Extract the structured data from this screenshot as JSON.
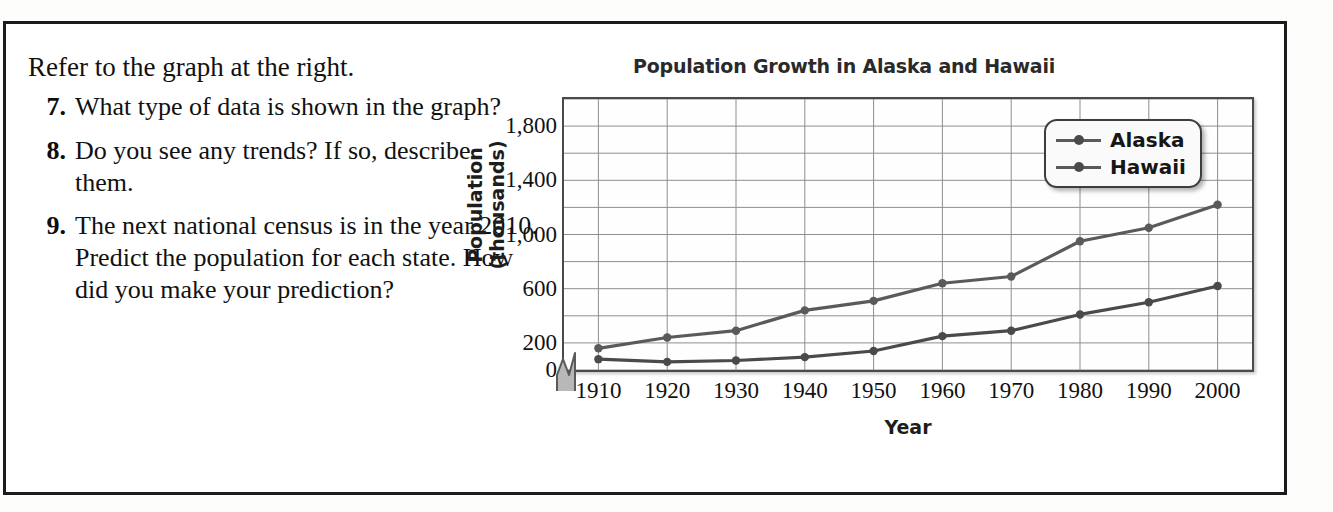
{
  "panel": {
    "intro": "Refer to the graph at the right.",
    "questions": [
      {
        "num": "7.",
        "text": "What type of data is shown in the graph?"
      },
      {
        "num": "8.",
        "text": "Do you see any trends? If so, describe them."
      },
      {
        "num": "9.",
        "text": "The next national census is in the year 2010. Predict the population for each state. How did you make your prediction?"
      }
    ]
  },
  "chart_data": {
    "type": "line",
    "title": "Population Growth in Alaska and Hawaii",
    "xlabel": "Year",
    "ylabel": "Population (thousands)",
    "categories": [
      "1910",
      "1920",
      "1930",
      "1940",
      "1950",
      "1960",
      "1970",
      "1980",
      "1990",
      "2000"
    ],
    "x": [
      1910,
      1920,
      1930,
      1940,
      1950,
      1960,
      1970,
      1980,
      1990,
      2000
    ],
    "ytick_labels": [
      "1,800",
      "1,400",
      "1,000",
      "600",
      "200",
      "0"
    ],
    "ytick_values": [
      1800,
      1400,
      1000,
      600,
      200,
      0
    ],
    "gridline_values": [
      2000,
      1800,
      1600,
      1400,
      1200,
      1000,
      800,
      600,
      400,
      200,
      0
    ],
    "ylim": [
      0,
      2000
    ],
    "xlim": [
      1905,
      2005
    ],
    "grid": true,
    "axis_break": true,
    "legend_position": "top-right",
    "series": [
      {
        "name": "Alaska",
        "color": "#5a5a5a",
        "values": [
          160,
          240,
          290,
          440,
          510,
          640,
          690,
          950,
          1050,
          1220
        ]
      },
      {
        "name": "Hawaii",
        "color": "#4a4a4a",
        "values": [
          80,
          60,
          70,
          95,
          140,
          250,
          290,
          410,
          500,
          620
        ]
      }
    ]
  }
}
